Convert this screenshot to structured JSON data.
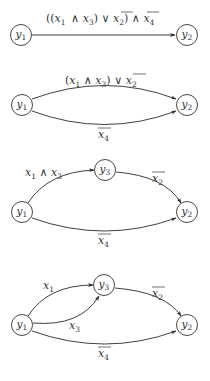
{
  "diagrams": [
    {
      "id": "diagram-1",
      "nodes": [
        {
          "name": "y1",
          "label": "y",
          "sub": "1",
          "cx": 21,
          "cy": 35
        },
        {
          "name": "y2",
          "label": "y",
          "sub": "2",
          "cx": 187,
          "cy": 35
        }
      ],
      "edges": [
        {
          "from": "y1",
          "to": "y2",
          "label": "((x1 ∧ x3) ∨ ¬x2) ∧ ¬x4"
        }
      ]
    },
    {
      "id": "diagram-2",
      "nodes": [
        {
          "name": "y1",
          "label": "y",
          "sub": "1",
          "cx": 22,
          "cy": 105
        },
        {
          "name": "y2",
          "label": "y",
          "sub": "2",
          "cx": 187,
          "cy": 105
        }
      ],
      "edges": [
        {
          "from": "y1",
          "to": "y2",
          "label": "(x1 ∧ x3) ∨ ¬x2",
          "curve": "upper"
        },
        {
          "from": "y1",
          "to": "y2",
          "label": "¬x4",
          "curve": "lower"
        }
      ]
    },
    {
      "id": "diagram-3",
      "nodes": [
        {
          "name": "y1",
          "label": "y",
          "sub": "1",
          "cx": 22,
          "cy": 212
        },
        {
          "name": "y3",
          "label": "y",
          "sub": "3",
          "cx": 105,
          "cy": 170
        },
        {
          "name": "y2",
          "label": "y",
          "sub": "2",
          "cx": 187,
          "cy": 212
        }
      ],
      "edges": [
        {
          "from": "y1",
          "to": "y3",
          "label": "x1 ∧ x3"
        },
        {
          "from": "y3",
          "to": "y2",
          "label": "¬x2"
        },
        {
          "from": "y1",
          "to": "y2",
          "label": "¬x4"
        }
      ]
    },
    {
      "id": "diagram-4",
      "nodes": [
        {
          "name": "y1",
          "label": "y",
          "sub": "1",
          "cx": 22,
          "cy": 325
        },
        {
          "name": "y3",
          "label": "y",
          "sub": "3",
          "cx": 104,
          "cy": 285
        },
        {
          "name": "y2",
          "label": "y",
          "sub": "2",
          "cx": 187,
          "cy": 325
        }
      ],
      "edges": [
        {
          "from": "y1",
          "to": "y3",
          "label": "x1",
          "curve": "upper"
        },
        {
          "from": "y1",
          "to": "y3",
          "label": "x3",
          "curve": "lower"
        },
        {
          "from": "y3",
          "to": "y2",
          "label": "¬x2"
        },
        {
          "from": "y1",
          "to": "y2",
          "label": "¬x4"
        }
      ]
    }
  ],
  "symbols": {
    "y": "y",
    "x": "x",
    "and": "∧",
    "or": "∨",
    "lparen": "(",
    "rparen": ")",
    "lparen2": "((",
    "sub1": "1",
    "sub2": "2",
    "sub3": "3",
    "sub4": "4"
  }
}
